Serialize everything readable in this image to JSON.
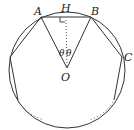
{
  "diagram": {
    "type": "regular polygon inscribed in circle",
    "colors": {
      "stroke": "#333333",
      "background": "#ffffff"
    },
    "labels": {
      "A": "A",
      "H": "H",
      "B": "B",
      "C": "C",
      "O": "O",
      "theta_left": "θ",
      "theta_right": "θ"
    },
    "points": {
      "O": [
        67,
        68
      ],
      "A": [
        41,
        17
      ],
      "B": [
        91,
        17
      ],
      "H": [
        66,
        17
      ],
      "C": [
        122,
        57
      ],
      "left_vertex": [
        10,
        57
      ],
      "lower_left": [
        18,
        100
      ],
      "lower_right": [
        114,
        100
      ]
    },
    "circle": {
      "cx": 67,
      "cy": 70,
      "r": 58
    },
    "annotations": {
      "right_angle_at": "H",
      "dotted_segment": "O-H",
      "omitted_sides": "dotted arcs at bottom"
    }
  }
}
